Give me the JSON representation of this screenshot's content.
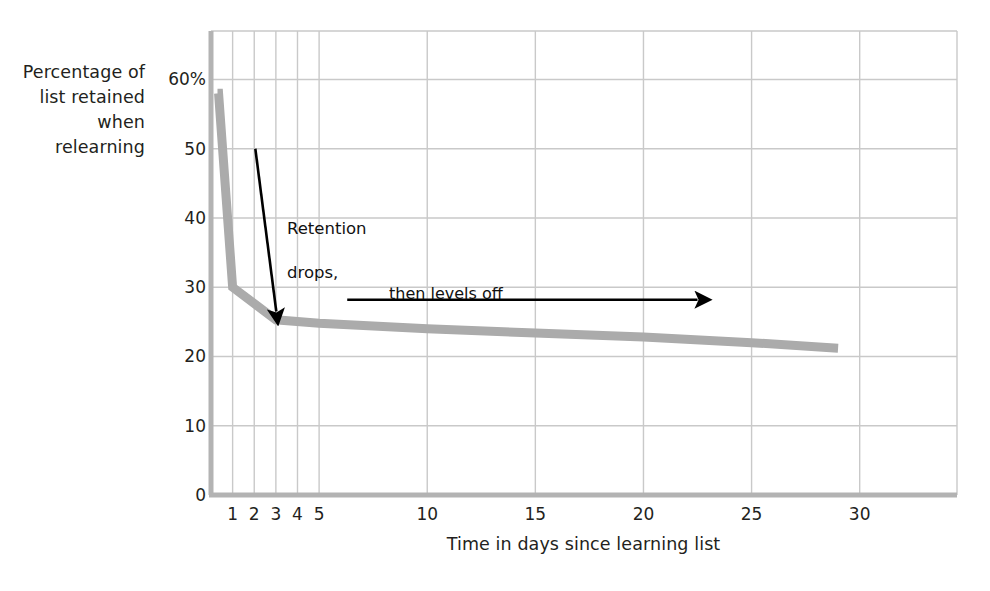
{
  "chart_data": {
    "type": "line",
    "title": "",
    "subtitle": "",
    "xlabel": "Time in days since learning list",
    "ylabel": "Percentage of\nlist retained\nwhen\nrelearning",
    "ylabel_lines": [
      "Percentage of",
      "list retained",
      "when",
      "relearning"
    ],
    "xlim": [
      0,
      34.5
    ],
    "ylim": [
      0,
      67
    ],
    "grid": true,
    "legend": "none",
    "xticks": [
      1,
      2,
      3,
      4,
      5,
      10,
      15,
      20,
      25,
      30
    ],
    "xtick_labels": [
      "1",
      "2",
      "3",
      "4",
      "5",
      "10",
      "15",
      "20",
      "25",
      "30"
    ],
    "yticks": [
      0,
      10,
      20,
      30,
      40,
      50,
      60
    ],
    "ytick_labels": [
      "0",
      "10",
      "20",
      "30",
      "40",
      "50",
      "60%"
    ],
    "series": [
      {
        "name": "Percentage of list retained when relearning",
        "color": "#ababab",
        "line_width": 9,
        "x": [
          0.3,
          0.35,
          1.0,
          3.0,
          5.0,
          10.0,
          15.0,
          20.0,
          25.0,
          29.0
        ],
        "values": [
          58,
          58,
          30,
          25.3,
          24.8,
          24.0,
          23.4,
          22.8,
          22.0,
          21.2
        ]
      }
    ],
    "annotations": [
      {
        "id": "retention-drops",
        "text": "Retention\ndrops,",
        "text_x": 3.5,
        "text_y": 45,
        "arrow": {
          "type": "straight",
          "from_x": 2.05,
          "from_y": 50.0,
          "to_x": 3.02,
          "to_y": 26.5,
          "color": "#000000"
        }
      },
      {
        "id": "then-levels-off",
        "text": "then levels off",
        "text_x": 8.2,
        "text_y": 30.5,
        "arrow": {
          "type": "horizontal",
          "from_x": 6.3,
          "from_y": 28.2,
          "to_x": 22.5,
          "to_y": 28.2,
          "color": "#000000"
        }
      }
    ],
    "colors": {
      "curve": "#ababab",
      "grid": "#c9c9c9",
      "axis": "#b3b3b3",
      "text": "#231f20",
      "annotation": "#111111",
      "background": "#ffffff"
    }
  },
  "axis_titles": {
    "x": "Time in days since learning list",
    "y_line_1": "Percentage of",
    "y_line_2": "list retained",
    "y_line_3": "when",
    "y_line_4": "relearning"
  },
  "annotations": {
    "retention_line_1": "Retention",
    "retention_line_2": "drops,",
    "levels_off": "then levels off"
  }
}
